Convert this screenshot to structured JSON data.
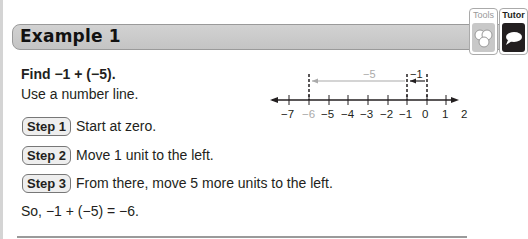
{
  "header": {
    "title": "Example 1"
  },
  "toolbar": {
    "tools_label": "Tools",
    "tutor_label": "Tutor",
    "tools_color": "#c8c8c8",
    "tutor_color": "#231f20"
  },
  "problem": {
    "find": "Find −1 + (−5).",
    "instruction": "Use a number line."
  },
  "steps": [
    {
      "badge": "Step 1",
      "text": "Start at zero."
    },
    {
      "badge": "Step 2",
      "text": "Move 1 unit to the left."
    },
    {
      "badge": "Step 3",
      "text": "From there, move 5 more units to the left."
    }
  ],
  "result": "So, −1 + (−5) = −6.",
  "number_line": {
    "ticks": [
      "−7",
      "−6",
      "−5",
      "−4",
      "−3",
      "−2",
      "−1",
      "0",
      "1",
      "2"
    ],
    "highlight_tick": "−6",
    "arrow_small_label": "−1",
    "arrow_large_label": "−5"
  }
}
